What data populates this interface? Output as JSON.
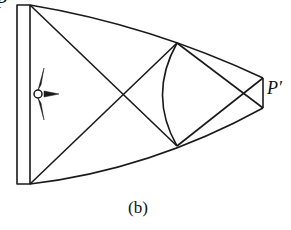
{
  "figure": {
    "caption": "(b)",
    "labels": {
      "p": "P",
      "p_prime": "P′"
    },
    "icons": {
      "observer": "compass-star-icon"
    },
    "colors": {
      "stroke": "#1a1a1a",
      "background": "#ffffff"
    }
  }
}
